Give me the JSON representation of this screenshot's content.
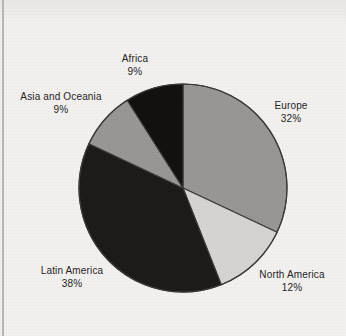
{
  "figure": {
    "background_color": "#f3f1ef",
    "border_color": "#b9b7b4"
  },
  "chart_data": {
    "type": "pie",
    "title": "",
    "subtitle": "",
    "xlabel": "",
    "ylabel": "",
    "legend_position": "none",
    "grid": false,
    "start_angle_deg": 0,
    "direction": "clockwise",
    "units": "percent",
    "total": 100,
    "categories": [
      "Europe",
      "North America",
      "Latin America",
      "Asia and Oceania",
      "Africa"
    ],
    "values": [
      32,
      12,
      38,
      9,
      9
    ],
    "slices": [
      {
        "label": "Europe",
        "value": 32,
        "value_text": "32%",
        "color": "#999794",
        "start_deg": 0,
        "end_deg": 115.2,
        "label_position": "right"
      },
      {
        "label": "North America",
        "value": 12,
        "value_text": "12%",
        "color": "#d6d4d1",
        "start_deg": 115.2,
        "end_deg": 158.4,
        "label_position": "bottom-right"
      },
      {
        "label": "Latin America",
        "value": 38,
        "value_text": "38%",
        "color": "#1c1b19",
        "start_deg": 158.4,
        "end_deg": 295.2,
        "label_position": "bottom-left"
      },
      {
        "label": "Asia and Oceania",
        "value": 9,
        "value_text": "9%",
        "color": "#999794",
        "start_deg": 295.2,
        "end_deg": 327.6,
        "label_position": "left"
      },
      {
        "label": "Africa",
        "value": 9,
        "value_text": "9%",
        "color": "#121110",
        "start_deg": 327.6,
        "end_deg": 360,
        "label_position": "top"
      }
    ],
    "geometry": {
      "center_x": 183,
      "center_y": 188,
      "radius": 104,
      "outline_color": "#3a3a38"
    }
  },
  "labels": {
    "africa": {
      "name": "Africa",
      "pct": "9%"
    },
    "asia": {
      "name": "Asia and Oceania",
      "pct": "9%"
    },
    "europe": {
      "name": "Europe",
      "pct": "32%"
    },
    "north": {
      "name": "North America",
      "pct": "12%"
    },
    "latin": {
      "name": "Latin America",
      "pct": "38%"
    }
  }
}
